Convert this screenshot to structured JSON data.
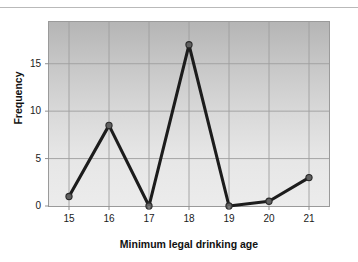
{
  "chart_data": {
    "type": "line",
    "title": "",
    "xlabel": "Minimum legal drinking age",
    "ylabel": "Frequency",
    "categories": [
      15,
      16,
      17,
      18,
      19,
      20,
      21
    ],
    "x": [
      15,
      16,
      17,
      18,
      19,
      20,
      21
    ],
    "values": [
      1,
      8.5,
      0,
      17,
      0,
      0.5,
      3
    ],
    "series": [
      {
        "name": "Frequency",
        "values": [
          1,
          8.5,
          0,
          17,
          0,
          0.5,
          3
        ]
      }
    ],
    "xtick_labels": [
      "15",
      "16",
      "17",
      "18",
      "19",
      "20",
      "21"
    ],
    "ytick_labels": [
      "0",
      "5",
      "10",
      "15"
    ],
    "yticks": [
      0,
      5,
      10,
      15
    ],
    "xlim": [
      14.5,
      21.5
    ],
    "ylim": [
      0,
      19.4
    ],
    "grid": true,
    "legend": false,
    "legend_position": "none",
    "marker": "circle",
    "line_color": "#1c1c1c",
    "marker_color": "#5b5b5b",
    "grid_color": "#9a9a9a",
    "plot_background": "#cfcfcf"
  },
  "colors": {
    "line": "#1c1c1c",
    "marker_fill": "#606060",
    "marker_edge": "#2a2a2a",
    "grid": "#9e9e9e",
    "axis": "#8f8f8f",
    "text": "#111111",
    "page_background": "#ffffff",
    "top_rule": "#b9b9b9"
  }
}
